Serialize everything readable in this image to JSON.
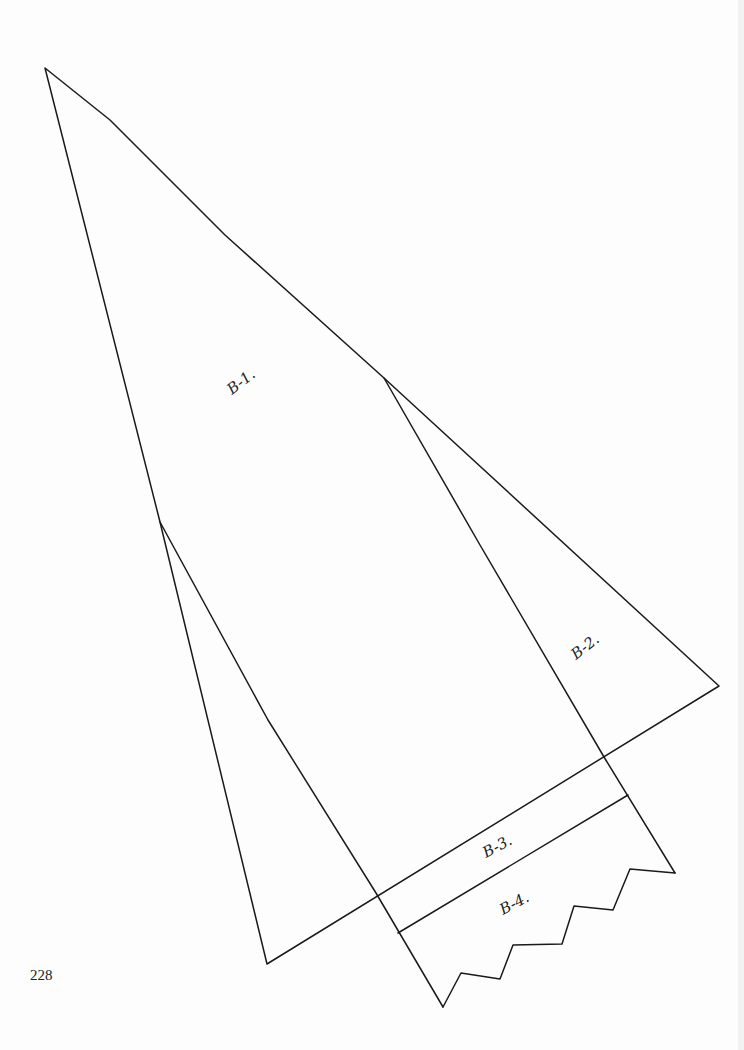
{
  "page": {
    "number": "228"
  },
  "pattern": {
    "pieces": [
      {
        "id": "B-1",
        "label": "B-1."
      },
      {
        "id": "B-2",
        "label": "B-2."
      },
      {
        "id": "B-3",
        "label": "B-3."
      },
      {
        "id": "B-4",
        "label": "B-4."
      }
    ]
  },
  "colors": {
    "line": "#1a1a1a",
    "background": "#fdfdfd"
  }
}
